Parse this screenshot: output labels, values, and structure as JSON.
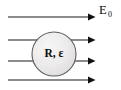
{
  "figure": {
    "background_color": "#ffffff",
    "width": 121,
    "height": 90
  },
  "sphere": {
    "label": "R, ε",
    "radius_symbol": "R",
    "permittivity_symbol": "ε",
    "separator": ", ",
    "center_x": 54,
    "center_y": 54,
    "radius": 22,
    "fill_color": "#eceaea",
    "fill_color_highlight": "#f6f5f5",
    "fill_color_shadow": "#dedcdc",
    "stroke_color": "#5d5d5d"
  },
  "field": {
    "label_main": "E",
    "label_sub": "0",
    "label_full": "E₀",
    "label_x": 99,
    "label_y": 14,
    "color": "#1a1a1a",
    "direction": "left-to-right",
    "count": 4,
    "lines": [
      {
        "id": "field-line-1",
        "y": 17,
        "x_start": 8,
        "x_end": 95,
        "passes_through_sphere": false
      },
      {
        "id": "field-line-2",
        "y": 40,
        "x_start": 8,
        "x_end": 95,
        "passes_through_sphere": true
      },
      {
        "id": "field-line-3",
        "y": 61,
        "x_start": 8,
        "x_end": 95,
        "passes_through_sphere": true
      },
      {
        "id": "field-line-4",
        "y": 80,
        "x_start": 8,
        "x_end": 95,
        "passes_through_sphere": false
      }
    ]
  }
}
